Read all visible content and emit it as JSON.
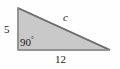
{
  "figure": {
    "type": "right-triangle-geometry-diagram",
    "background_color": "#fefefe",
    "fill_color": "#c9c9c9",
    "stroke_color": "#8a8a8a",
    "hypotenuse_stroke_color": "#6e6e6e",
    "label_color": "#1a1a1a",
    "vertices": {
      "apex_top_left": [
        18,
        8
      ],
      "right_angle_bottom_left": [
        18,
        50
      ],
      "bottom_right": [
        110,
        50
      ]
    },
    "labels": {
      "vertical_leg": "5",
      "right_angle": "90",
      "degree_symbol": "°",
      "hypotenuse": "c",
      "horizontal_leg": "12"
    }
  }
}
